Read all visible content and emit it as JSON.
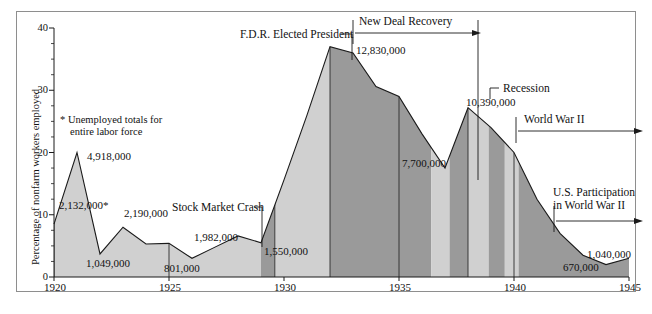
{
  "chart_data": {
    "type": "area",
    "title": "",
    "xlabel": "",
    "ylabel": "Percentage of nonfarm workers employed",
    "xlim": [
      1920,
      1945
    ],
    "ylim": [
      0,
      40
    ],
    "grid": false,
    "legend": "none",
    "y_ticks": [
      0,
      10,
      20,
      30,
      40
    ],
    "y_tick_labels": [
      "0",
      "10",
      "20",
      "30",
      "40"
    ],
    "y_minor_step": 2.5,
    "x_ticks": [
      1920,
      1925,
      1930,
      1935,
      1940,
      1945
    ],
    "x_tick_labels": [
      "1920",
      "1925",
      "1930",
      "1935",
      "1940",
      "1945"
    ],
    "x": [
      1920,
      1921,
      1922,
      1923,
      1924,
      1925,
      1926,
      1927,
      1928,
      1929,
      1930,
      1931,
      1932,
      1933,
      1934,
      1935,
      1936,
      1937,
      1938,
      1939,
      1940,
      1941,
      1942,
      1943,
      1944,
      1945
    ],
    "values": [
      8.5,
      20.0,
      3.7,
      8.0,
      5.3,
      5.4,
      3.0,
      4.8,
      6.6,
      5.5,
      15.6,
      26.0,
      37.0,
      36.0,
      30.6,
      29.0,
      23.0,
      17.5,
      27.2,
      24.0,
      20.0,
      12.5,
      7.0,
      3.5,
      2.0,
      3.0
    ],
    "series": [
      {
        "name": "Percentage of nonfarm workers unemployed",
        "values": [
          8.5,
          20.0,
          3.7,
          8.0,
          5.3,
          5.4,
          3.0,
          4.8,
          6.6,
          5.5,
          15.6,
          26.0,
          37.0,
          36.0,
          30.6,
          29.0,
          23.0,
          17.5,
          27.2,
          24.0,
          20.0,
          12.5,
          7.0,
          3.5,
          2.0,
          3.0
        ]
      }
    ],
    "data_labels": [
      {
        "text": "2,132,000*",
        "year": 1920,
        "value": 8.5
      },
      {
        "text": "4,918,000",
        "year": 1921,
        "value": 20.0
      },
      {
        "text": "1,049,000",
        "year": 1922,
        "value": 3.7
      },
      {
        "text": "2,190,000",
        "year": 1923,
        "value": 8.0
      },
      {
        "text": "801,000",
        "year": 1926,
        "value": 3.0
      },
      {
        "text": "1,982,000",
        "year": 1928,
        "value": 6.6
      },
      {
        "text": "1,550,000",
        "year": 1929,
        "value": 5.5
      },
      {
        "text": "12,830,000",
        "year": 1932,
        "value": 37.0
      },
      {
        "text": "7,700,000",
        "year": 1935,
        "value": 29.0
      },
      {
        "text": "10,390,000",
        "year": 1938,
        "value": 27.2
      },
      {
        "text": "670,000",
        "year": 1944,
        "value": 2.0
      },
      {
        "text": "1,040,000",
        "year": 1945,
        "value": 3.0
      }
    ],
    "annotations": [
      {
        "text": "F.D.R. Elected President",
        "year": 1932,
        "kind": "leader-label"
      },
      {
        "text": "New Deal Recovery",
        "year_start": 1933,
        "year_end": 1937,
        "kind": "span-arrow"
      },
      {
        "text": "Stock Market Crash",
        "year": 1929,
        "kind": "leader-label"
      },
      {
        "text": "Recession",
        "year": 1938,
        "kind": "leader-label"
      },
      {
        "text": "World War II",
        "year_start": 1939,
        "year_end": 1945,
        "kind": "span-arrow"
      },
      {
        "text": "U.S. Participation in World War II",
        "year_start": 1941,
        "year_end": 1945,
        "kind": "span-arrow"
      }
    ],
    "footnote": "* Unemployed totals for entire labor force",
    "colors": {
      "band_light": "#d0d0d0",
      "band_dark": "#9a9a9a",
      "line": "#1a1a1a",
      "frame": "#8e8e8e",
      "text": "#111111"
    },
    "bands": [
      {
        "from": 1920,
        "to": 1929,
        "shade": "light"
      },
      {
        "from": 1929,
        "to": 1929.6,
        "shade": "dark"
      },
      {
        "from": 1929.6,
        "to": 1932,
        "shade": "light"
      },
      {
        "from": 1932,
        "to": 1936.4,
        "shade": "dark"
      },
      {
        "from": 1936.4,
        "to": 1937.2,
        "shade": "light"
      },
      {
        "from": 1937.2,
        "to": 1938,
        "shade": "dark"
      },
      {
        "from": 1938,
        "to": 1938.9,
        "shade": "light"
      },
      {
        "from": 1938.9,
        "to": 1939.6,
        "shade": "dark"
      },
      {
        "from": 1939.6,
        "to": 1940.2,
        "shade": "light"
      },
      {
        "from": 1940.2,
        "to": 1945,
        "shade": "dark"
      }
    ],
    "dividers": [
      1920,
      1925,
      1929.6,
      1932,
      1935,
      1938,
      1940
    ]
  },
  "axes": {
    "y_label": "Percentage of nonfarm workers employed",
    "y_ticks": [
      "40",
      "30",
      "20",
      "10",
      "0"
    ],
    "x_ticks": [
      "1920",
      "1925",
      "1930",
      "1935",
      "1940",
      "1945"
    ]
  },
  "data_labels": {
    "l1920": "2,132,000*",
    "l1921": "4,918,000",
    "l1922": "1,049,000",
    "l1923": "2,190,000",
    "l1926": "801,000",
    "l1928": "1,982,000",
    "l1929": "1,550,000",
    "l1932": "12,830,000",
    "l1935": "7,700,000",
    "l1938": "10,390,000",
    "l1944": "670,000",
    "l1945": "1,040,000"
  },
  "annotations": {
    "fdr": "F.D.R. Elected President",
    "new_deal": "New Deal Recovery",
    "crash": "Stock Market Crash",
    "recession": "Recession",
    "wwii": "World War II",
    "us_participation_line1": "U.S. Participation",
    "us_participation_line2": "in World War II"
  },
  "footnote": {
    "line1": "* Unemployed totals for",
    "line2": "entire labor force"
  }
}
